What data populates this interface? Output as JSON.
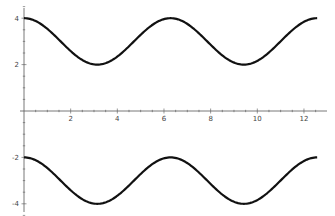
{
  "chart_data": {
    "type": "line",
    "title": "",
    "xlabel": "",
    "ylabel": "",
    "xlim": [
      0,
      12.566
    ],
    "ylim": [
      -4.3,
      4.3
    ],
    "grid": false,
    "legend": null,
    "x_ticks": [
      2,
      4,
      6,
      8,
      10,
      12
    ],
    "y_ticks": [
      -4,
      -2,
      2,
      4
    ],
    "series": [
      {
        "name": "upper curve (3 + cos x)",
        "x": [
          0,
          1.571,
          3.142,
          4.712,
          6.283,
          7.854,
          9.425,
          10.996,
          12.566
        ],
        "values": [
          4,
          3,
          2,
          3,
          4,
          3,
          2,
          3,
          4
        ],
        "color": "#111111"
      },
      {
        "name": "lower curve (-3 + cos x)",
        "x": [
          0,
          1.571,
          3.142,
          4.712,
          6.283,
          7.854,
          9.425,
          10.996,
          12.566
        ],
        "values": [
          -2,
          -3,
          -4,
          -3,
          -2,
          -3,
          -4,
          -3,
          -2
        ],
        "color": "#111111"
      }
    ]
  },
  "axes": {
    "x_tick_labels": [
      "2",
      "4",
      "6",
      "8",
      "10",
      "12"
    ],
    "y_tick_labels": [
      "4",
      "2",
      "-2",
      "-4"
    ]
  }
}
